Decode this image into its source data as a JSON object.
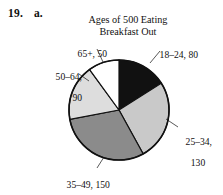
{
  "problem": {
    "number": "19.",
    "part": "a."
  },
  "chart_data": {
    "type": "pie",
    "title": "Ages of 500 Eating Breakfast Out",
    "title_line1": "Ages of 500 Eating",
    "title_line2": "Breakfast Out",
    "total": 500,
    "xlabel": "",
    "ylabel": "",
    "grid": false,
    "legend_position": "none",
    "start_angle_deg": 0,
    "direction": "clockwise",
    "categories": [
      "18–24",
      "25–34",
      "35–49",
      "50–64",
      "65+"
    ],
    "values": [
      80,
      130,
      150,
      90,
      50
    ],
    "colors": [
      "#111111",
      "#c9c9c9",
      "#8b8b8b",
      "#dddddd",
      "#ffffff"
    ],
    "slices": [
      {
        "category": "18–24",
        "value": 80,
        "label": "18–24, 80",
        "label_line1": "18–24, 80",
        "label_line2": "",
        "color": "#111111",
        "percent": 16,
        "angle_deg": 57.6
      },
      {
        "category": "25–34",
        "value": 130,
        "label": "25–34, 130",
        "label_line1": "25–34,",
        "label_line2": "130",
        "color": "#c9c9c9",
        "percent": 26,
        "angle_deg": 93.6
      },
      {
        "category": "35–49",
        "value": 150,
        "label": "35–49, 150",
        "label_line1": "35–49, 150",
        "label_line2": "",
        "color": "#8b8b8b",
        "percent": 30,
        "angle_deg": 108
      },
      {
        "category": "50–64",
        "value": 90,
        "label": "50–64, 90",
        "label_line1": "50–64,",
        "label_line2": "90",
        "color": "#dddddd",
        "percent": 18,
        "angle_deg": 64.8
      },
      {
        "category": "65+",
        "value": 50,
        "label": "65+, 50",
        "label_line1": "65+, 50",
        "label_line2": "",
        "color": "#ffffff",
        "percent": 10,
        "angle_deg": 36
      }
    ]
  }
}
